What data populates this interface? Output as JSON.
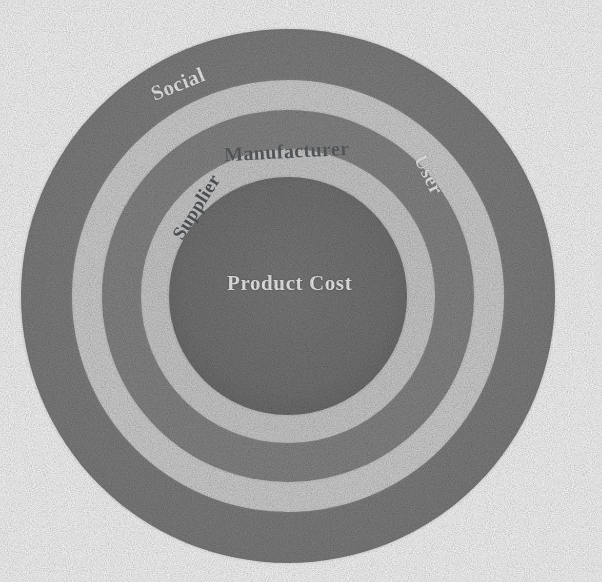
{
  "diagram": {
    "type": "concentric-rings",
    "center_label": "Product Cost",
    "rings": [
      {
        "name": "social",
        "label": "Social",
        "kind": "band",
        "color": "#8b8b8b",
        "outer_radius": 267,
        "inner_radius": 216
      },
      {
        "name": "separator-1",
        "label": "",
        "kind": "separator",
        "color": "#dedede",
        "outer_radius": 216,
        "inner_radius": 186
      },
      {
        "name": "manufacturer",
        "label": "Manufacturer",
        "kind": "band",
        "color": "#8f8f8f",
        "outer_radius": 186,
        "inner_radius": 147
      },
      {
        "name": "supplier",
        "label": "Supplier",
        "kind": "separator",
        "color": "#d9d9d9",
        "outer_radius": 147,
        "inner_radius": 119
      },
      {
        "name": "product-cost",
        "label": "Product Cost",
        "kind": "core",
        "color": "#7b7b7b",
        "outer_radius": 119,
        "inner_radius": 0
      }
    ],
    "edge_labels": [
      {
        "name": "social",
        "text": "Social",
        "rotation_deg": -22
      },
      {
        "name": "user",
        "text": "User",
        "rotation_deg": 64
      },
      {
        "name": "supplier",
        "text": "Supplier",
        "rotation_deg": -58
      },
      {
        "name": "manufacturer",
        "text": "Manufacturer",
        "rotation_deg": -3
      }
    ],
    "geometry": {
      "center_x": 288,
      "center_y": 296,
      "outer_radius": 267
    },
    "colors": {
      "background": "#ffffff",
      "outer_ring": "#8b8b8b",
      "light_ring": "#dedede",
      "mid_ring": "#8f8f8f",
      "inner_light_ring": "#d9d9d9",
      "core": "#7b7b7b",
      "label_light": "#f2f2f2",
      "label_dark": "#5c6063"
    }
  }
}
